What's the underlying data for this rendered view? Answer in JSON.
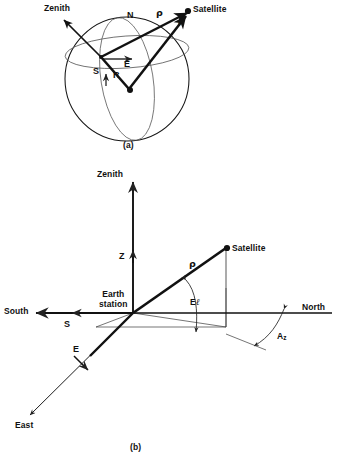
{
  "figure": {
    "panels": [
      {
        "id": "a",
        "caption": "(a)"
      },
      {
        "id": "b",
        "caption": "(b)"
      }
    ]
  },
  "panel_a": {
    "caption": "(a)",
    "labels": {
      "zenith": "Zenith",
      "satellite": "Satellite",
      "north_pole": "N",
      "south_pole": "S",
      "rho": "ρ",
      "r_vector": "r",
      "R_vector": "R",
      "E_vector": "E"
    },
    "description": "Earth sphere with earth station on the surface, zenith direction, vectors R from earth center to station, rho from station to satellite, r from earth center to satellite, and E eastward vector."
  },
  "panel_b": {
    "caption": "(b)",
    "labels": {
      "zenith": "Zenith",
      "z_vector": "Z",
      "satellite": "Satellite",
      "rho": "ρ",
      "earth_station_line1": "Earth",
      "earth_station_line2": "station",
      "south": "South",
      "s_vector": "S",
      "north": "North",
      "east": "East",
      "e_vector": "E",
      "elevation": "El",
      "elevation_letter": "E",
      "elevation_script": "ℓ",
      "azimuth_letter": "A",
      "azimuth_subscript": "z"
    },
    "description": "Topocentric horizon coordinate system at the earth station showing Zenith (Z), South (S), East (E) axes, slant range vector rho to the satellite, elevation angle El and azimuth angle Az measured from North."
  },
  "style": {
    "ink": "#111111",
    "thin_line": "#333333",
    "background": "#ffffff"
  }
}
